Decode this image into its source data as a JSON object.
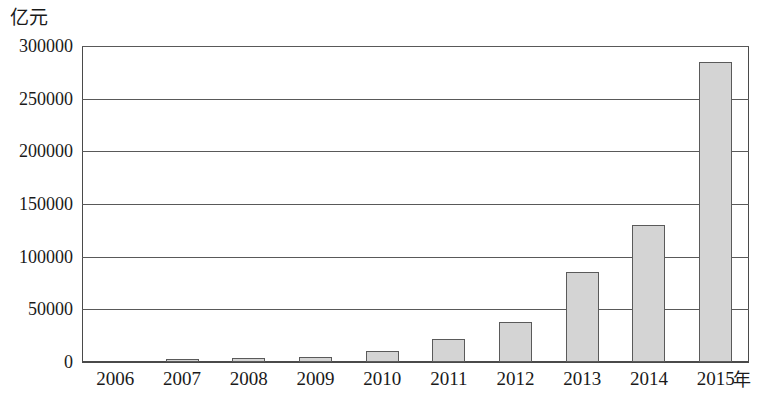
{
  "chart_data": {
    "type": "bar",
    "title": "",
    "subtitle": "",
    "xlabel": "年",
    "ylabel": "亿元",
    "categories": [
      "2006",
      "2007",
      "2008",
      "2009",
      "2010",
      "2011",
      "2012",
      "2013",
      "2014",
      "2015"
    ],
    "values": [
      0,
      3000,
      4000,
      5000,
      10000,
      22000,
      38000,
      85000,
      130000,
      285000
    ],
    "ylim": [
      0,
      300000
    ],
    "y_ticks": [
      0,
      50000,
      100000,
      150000,
      200000,
      250000,
      300000
    ],
    "y_tick_labels": [
      "0",
      "50000",
      "100000",
      "150000",
      "200000",
      "250000",
      "300000"
    ],
    "grid": true,
    "legend": false,
    "legend_position": "none",
    "series": [
      {
        "name": "",
        "values": [
          0,
          3000,
          4000,
          5000,
          10000,
          22000,
          38000,
          85000,
          130000,
          285000
        ]
      }
    ],
    "colors": {
      "bar_fill": "#d4d4d4",
      "bar_border": "#5a5a5a",
      "axis": "#4a4a4a",
      "grid": "#595959",
      "text": "#1a1a1a",
      "background": "#ffffff"
    }
  }
}
